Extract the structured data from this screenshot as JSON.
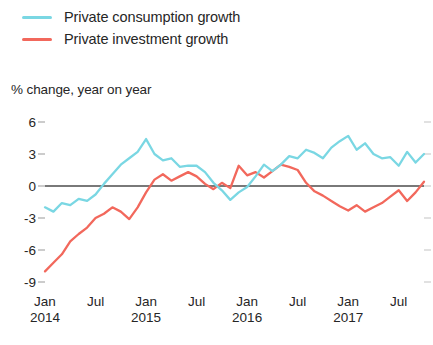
{
  "legend": {
    "position": "top-left",
    "entries": [
      {
        "label": "Private consumption growth",
        "color": "#7ad7e3",
        "swatch_name": "legend-swatch-consumption"
      },
      {
        "label": "Private investment growth",
        "color": "#f2685c",
        "swatch_name": "legend-swatch-investment"
      }
    ]
  },
  "axis_title": "% change, year on year",
  "yticks": [
    "6",
    "3",
    "0",
    "-3",
    "-6",
    "-9"
  ],
  "xticks": [
    {
      "month": "Jan",
      "year": "2014"
    },
    {
      "month": "Jul",
      "year": ""
    },
    {
      "month": "Jan",
      "year": "2015"
    },
    {
      "month": "Jul",
      "year": ""
    },
    {
      "month": "Jan",
      "year": "2016"
    },
    {
      "month": "Jul",
      "year": ""
    },
    {
      "month": "Jan",
      "year": "2017"
    },
    {
      "month": "Jul",
      "year": ""
    }
  ],
  "chart_data": {
    "type": "line",
    "title": "",
    "subtitle": "",
    "xlabel": "",
    "ylabel": "% change, year on year",
    "ylim": [
      -9,
      6
    ],
    "ytick_values": [
      6,
      3,
      0,
      -3,
      -6,
      -9
    ],
    "grid": false,
    "zero_line": true,
    "legend_position": "top-left",
    "x_axis_type": "monthly",
    "x_start": "2014-01",
    "x_end": "2017-10",
    "x_tick_labels": [
      "Jan 2014",
      "Jul",
      "Jan 2015",
      "Jul",
      "Jan 2016",
      "Jul",
      "Jan 2017",
      "Jul"
    ],
    "x": [
      "2014-01",
      "2014-02",
      "2014-03",
      "2014-04",
      "2014-05",
      "2014-06",
      "2014-07",
      "2014-08",
      "2014-09",
      "2014-10",
      "2014-11",
      "2014-12",
      "2015-01",
      "2015-02",
      "2015-03",
      "2015-04",
      "2015-05",
      "2015-06",
      "2015-07",
      "2015-08",
      "2015-09",
      "2015-10",
      "2015-11",
      "2015-12",
      "2016-01",
      "2016-02",
      "2016-03",
      "2016-04",
      "2016-05",
      "2016-06",
      "2016-07",
      "2016-08",
      "2016-09",
      "2016-10",
      "2016-11",
      "2016-12",
      "2017-01",
      "2017-02",
      "2017-03",
      "2017-04",
      "2017-05",
      "2017-06",
      "2017-07",
      "2017-08",
      "2017-09",
      "2017-10"
    ],
    "series": [
      {
        "name": "Private consumption growth",
        "color": "#7ad7e3",
        "values": [
          -2.0,
          -2.4,
          -1.6,
          -1.8,
          -1.2,
          -1.4,
          -0.8,
          0.2,
          1.1,
          2.0,
          2.6,
          3.2,
          4.4,
          3.0,
          2.4,
          2.6,
          1.8,
          1.9,
          1.9,
          1.3,
          0.3,
          -0.4,
          -1.3,
          -0.6,
          -0.1,
          0.9,
          2.0,
          1.4,
          2.0,
          2.8,
          2.6,
          3.4,
          3.1,
          2.6,
          3.6,
          4.2,
          4.7,
          3.4,
          4.0,
          3.0,
          2.6,
          2.7,
          1.9,
          3.2,
          2.2,
          3.0
        ]
      },
      {
        "name": "Private investment growth",
        "color": "#f2685c",
        "values": [
          -8.0,
          -7.2,
          -6.4,
          -5.2,
          -4.5,
          -3.9,
          -3.0,
          -2.6,
          -2.0,
          -2.4,
          -3.1,
          -2.0,
          -0.6,
          0.6,
          1.1,
          0.5,
          0.9,
          1.3,
          0.9,
          0.2,
          -0.3,
          0.3,
          -0.2,
          1.9,
          1.0,
          1.3,
          0.8,
          1.4,
          2.0,
          1.8,
          1.5,
          0.3,
          -0.5,
          -0.9,
          -1.4,
          -1.9,
          -2.3,
          -1.8,
          -2.4,
          -2.0,
          -1.6,
          -1.0,
          -0.4,
          -1.4,
          -0.6,
          0.4
        ]
      }
    ]
  },
  "colors": {
    "consumption": "#7ad7e3",
    "investment": "#f2685c",
    "zero_line": "#4d4d4d",
    "tick": "#9a9a9a",
    "text": "#262626",
    "background": "#ffffff"
  }
}
